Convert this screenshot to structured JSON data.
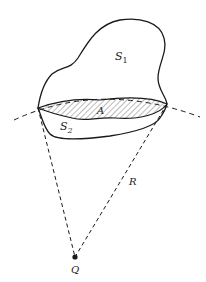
{
  "diagram": {
    "labels": {
      "s1": "S",
      "s1_sub": "1",
      "s2": "S",
      "s2_sub": "2",
      "a": "A",
      "r": "R",
      "q": "Q"
    },
    "colors": {
      "stroke": "#1a1a1a",
      "hatch": "#555555",
      "background": "#ffffff"
    }
  }
}
